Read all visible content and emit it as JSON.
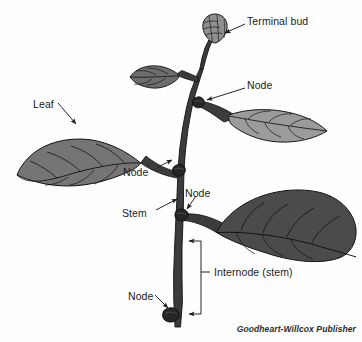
{
  "figure": {
    "type": "botanical-diagram",
    "background_color": "#fefefe",
    "credit": "Goodheart-Willcox Publisher"
  },
  "labels": [
    {
      "id": "terminal-bud",
      "text": "Terminal bud",
      "x": 247,
      "y": 16
    },
    {
      "id": "node-upper",
      "text": "Node",
      "x": 247,
      "y": 80
    },
    {
      "id": "leaf",
      "text": "Leaf",
      "x": 33,
      "y": 99
    },
    {
      "id": "node-left",
      "text": "Node",
      "x": 123,
      "y": 167
    },
    {
      "id": "node-mid",
      "text": "Node",
      "x": 185,
      "y": 188
    },
    {
      "id": "stem",
      "text": "Stem",
      "x": 122,
      "y": 208
    },
    {
      "id": "internode",
      "text": "Internode (stem)",
      "x": 214,
      "y": 267
    },
    {
      "id": "node-bottom",
      "text": "Node",
      "x": 128,
      "y": 291
    }
  ],
  "parts": {
    "stem_color": "#3b3b3b",
    "stem_outline": "#111111",
    "node_color": "#2b2b2b",
    "bud_color": "#8f8f8f",
    "leaf_left_color": "#757575",
    "leaf_small_upper_color": "#6d6d6d",
    "leaf_upper_right_color": "#9b9b9b",
    "leaf_lower_right_color": "#4b4b4b",
    "vein_color": "#151515",
    "leader_color": "#1a1a1a"
  },
  "structures": [
    {
      "name": "terminal-bud",
      "count": 1
    },
    {
      "name": "node",
      "count": 4
    },
    {
      "name": "leaf",
      "count": 4
    },
    {
      "name": "stem",
      "count": 1
    },
    {
      "name": "internode-bracket",
      "count": 1
    }
  ]
}
